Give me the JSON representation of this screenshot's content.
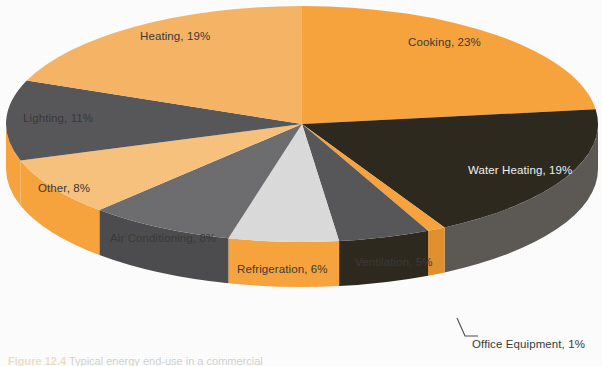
{
  "chart_data": {
    "type": "pie",
    "title": "",
    "subtitle": "",
    "xlabel": "",
    "ylabel": "",
    "legend_position": "none",
    "grid": false,
    "three_d": true,
    "start_angle_deg": 0,
    "direction": "clockwise",
    "categories": [
      "Cooking",
      "Water Heating",
      "Office Equipment",
      "Ventilation",
      "Refrigeration",
      "Air Conditioning",
      "Other",
      "Lighting",
      "Heating"
    ],
    "values": [
      23,
      19,
      1,
      5,
      6,
      8,
      8,
      11,
      19
    ],
    "value_unit": "%",
    "slices": [
      {
        "label": "Cooking, 23%",
        "name": "Cooking",
        "value": 23,
        "color": "#F9A53E",
        "side_color": "#E2912F",
        "text_color": "#3a3a3a",
        "label_x": 408,
        "label_y": 36
      },
      {
        "label": "Water Heating, 19%",
        "name": "Water Heating",
        "value": 19,
        "color": "#2F2A20",
        "side_color": "#5D5A55",
        "text_color": "#f2f2f2",
        "label_x": 468,
        "label_y": 164
      },
      {
        "label": "Office Equipment, 1%",
        "name": "Office Equipment",
        "value": 1,
        "color": "#F9A53E",
        "side_color": "#E2912F",
        "text_color": "#3a3a3a",
        "label_x": 472,
        "label_y": 338
      },
      {
        "label": "Ventilation, 5%",
        "name": "Ventilation",
        "value": 5,
        "color": "#58585A",
        "side_color": "#2F2A20",
        "text_color": "#3a3a3a",
        "label_x": 355,
        "label_y": 256
      },
      {
        "label": "Refrigeration, 6%",
        "name": "Refrigeration",
        "value": 6,
        "color": "#DCDCDC",
        "side_color": "#F9A53E",
        "text_color": "#3a3a3a",
        "label_x": 237,
        "label_y": 263
      },
      {
        "label": "Air Conditioning, 8%",
        "name": "Air Conditioning",
        "value": 8,
        "color": "#6E6E70",
        "side_color": "#4D4D4F",
        "text_color": "#3a3a3a",
        "label_x": 110,
        "label_y": 232
      },
      {
        "label": "Other, 8%",
        "name": "Other",
        "value": 8,
        "color": "#F8C37E",
        "side_color": "#F9A53E",
        "text_color": "#3a3a3a",
        "label_x": 38,
        "label_y": 182
      },
      {
        "label": "Lighting, 11%",
        "name": "Lighting",
        "value": 11,
        "color": "#58585A",
        "side_color": "#F9A53E",
        "text_color": "#3a3a3a",
        "label_x": 23,
        "label_y": 112
      },
      {
        "label": "Heating, 19%",
        "name": "Heating",
        "value": 19,
        "color": "#F8B566",
        "side_color": "#F9A53E",
        "text_color": "#3a3a3a",
        "label_x": 140,
        "label_y": 30
      }
    ],
    "callouts": [
      {
        "name": "office-equipment",
        "label": "Office Equipment, 1%"
      }
    ]
  },
  "caption": {
    "number": "Figure 12.4",
    "text": "Typical energy end-use in a commercial"
  },
  "colors": {
    "orange": "#F9A53E",
    "light_orange": "#F8C37E",
    "medium_orange": "#F8B566",
    "dark": "#2F2A20",
    "gray": "#58585A",
    "light_gray": "#DCDCDC",
    "mid_gray": "#6E6E70",
    "background": "#FFFFFF"
  }
}
